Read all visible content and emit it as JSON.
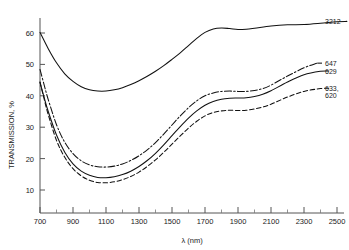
{
  "chart_data": {
    "type": "line",
    "title": "",
    "xlabel": "λ (nm)",
    "ylabel": "TRANSMISSION, %",
    "xlim": [
      700,
      2600
    ],
    "ylim": [
      0,
      65
    ],
    "grid": false,
    "legend_position": "right-inline-labels",
    "xticks": [
      700,
      900,
      1100,
      1300,
      1500,
      1700,
      1900,
      2100,
      2300,
      2500
    ],
    "xtick_labels": [
      "700",
      "900",
      "1100",
      "1300",
      "1500",
      "1700",
      "1900",
      "2100",
      "2300",
      "2500"
    ],
    "yticks": [
      10,
      20,
      30,
      40,
      50,
      60
    ],
    "ytick_labels": [
      "10",
      "20",
      "30",
      "40",
      "50",
      "60"
    ],
    "x_minor_tick_interval": 100,
    "series": [
      {
        "name": "3212",
        "label": "3212",
        "linestyle": "solid",
        "x": [
          700,
          750,
          800,
          850,
          900,
          950,
          1000,
          1050,
          1100,
          1150,
          1200,
          1250,
          1300,
          1350,
          1400,
          1450,
          1500,
          1550,
          1600,
          1650,
          1700,
          1750,
          1800,
          1850,
          1900,
          1950,
          2000,
          2100,
          2200,
          2300,
          2400,
          2500,
          2560
        ],
        "y": [
          60.2,
          55.0,
          50.5,
          47.0,
          44.6,
          42.9,
          41.9,
          41.5,
          41.5,
          41.9,
          42.6,
          43.6,
          44.8,
          46.2,
          47.8,
          49.6,
          51.6,
          53.7,
          56.0,
          58.3,
          60.2,
          61.3,
          61.6,
          61.4,
          61.1,
          61.2,
          61.5,
          62.2,
          62.6,
          62.7,
          63.1,
          63.6,
          63.7
        ]
      },
      {
        "name": "647",
        "label": "647",
        "linestyle": "dashdot",
        "x": [
          700,
          725,
          750,
          800,
          850,
          900,
          950,
          1000,
          1050,
          1100,
          1150,
          1200,
          1250,
          1300,
          1350,
          1400,
          1450,
          1500,
          1550,
          1600,
          1650,
          1700,
          1750,
          1800,
          1850,
          1900,
          1950,
          2000,
          2050,
          2100,
          2200,
          2300,
          2380
        ],
        "y": [
          48.4,
          43.5,
          38.8,
          30.8,
          25.2,
          21.6,
          19.3,
          18.0,
          17.4,
          17.3,
          17.6,
          18.3,
          19.4,
          20.9,
          22.8,
          25.1,
          27.8,
          30.7,
          33.6,
          36.2,
          38.4,
          40.0,
          40.9,
          41.4,
          41.5,
          41.4,
          41.4,
          41.7,
          42.3,
          43.4,
          46.3,
          48.9,
          50.4
        ]
      },
      {
        "name": "629",
        "label": "629",
        "linestyle": "solid",
        "x": [
          700,
          725,
          750,
          800,
          850,
          900,
          950,
          1000,
          1050,
          1100,
          1150,
          1200,
          1250,
          1300,
          1350,
          1400,
          1450,
          1500,
          1550,
          1600,
          1650,
          1700,
          1750,
          1800,
          1850,
          1900,
          1950,
          2000,
          2050,
          2100,
          2200,
          2300,
          2400,
          2450
        ],
        "y": [
          44.3,
          39.5,
          35.0,
          27.5,
          22.0,
          18.3,
          16.0,
          14.7,
          14.0,
          13.9,
          14.2,
          14.9,
          16.0,
          17.5,
          19.4,
          21.7,
          24.4,
          27.3,
          30.2,
          32.9,
          35.2,
          37.0,
          38.2,
          38.9,
          39.2,
          39.3,
          39.4,
          39.8,
          40.5,
          41.6,
          44.4,
          46.7,
          47.8,
          47.9
        ]
      },
      {
        "name": "633, 620",
        "label": "633,\n620",
        "linestyle": "dashed",
        "x": [
          700,
          725,
          750,
          800,
          850,
          900,
          950,
          1000,
          1050,
          1100,
          1150,
          1200,
          1250,
          1300,
          1350,
          1400,
          1450,
          1500,
          1550,
          1600,
          1650,
          1700,
          1750,
          1800,
          1850,
          1900,
          1950,
          2000,
          2050,
          2100,
          2200,
          2300,
          2400,
          2450
        ],
        "y": [
          44.4,
          39.0,
          34.0,
          25.8,
          20.4,
          16.8,
          14.5,
          13.1,
          12.4,
          12.3,
          12.6,
          13.3,
          14.3,
          15.7,
          17.5,
          19.6,
          22.0,
          24.6,
          27.2,
          29.7,
          31.9,
          33.6,
          34.7,
          35.2,
          35.4,
          35.3,
          35.4,
          35.8,
          36.4,
          37.3,
          39.6,
          41.4,
          42.3,
          42.4
        ]
      }
    ],
    "series_labels": [
      {
        "text": "3212",
        "value_at_right": 63.7
      },
      {
        "text": "647",
        "value_at_right": 50.4
      },
      {
        "text": "629",
        "value_at_right": 47.9
      },
      {
        "text": "633,",
        "value_at_right": 42.4
      },
      {
        "text": "620",
        "value_at_right": 42.4
      }
    ]
  },
  "axes": {
    "y_title": "TRANSMISSION, %",
    "x_title": "λ (nm)"
  },
  "colors": {
    "background": "#ffffff",
    "ink": "#111111",
    "axis": "#555555"
  }
}
